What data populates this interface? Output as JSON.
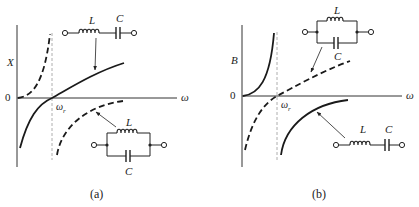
{
  "panels": [
    {
      "id": "a",
      "caption": "(a)",
      "y_axis_label": "X",
      "x_axis_label": "ω",
      "origin_label": "0",
      "resonance_label": "ω",
      "resonance_subscript": "r",
      "series_circuit": {
        "inductor_label": "L",
        "capacitor_label": "C",
        "curve_style": "solid"
      },
      "parallel_circuit": {
        "inductor_label": "L",
        "capacitor_label": "C",
        "curve_style": "dashed"
      }
    },
    {
      "id": "b",
      "caption": "(b)",
      "y_axis_label": "B",
      "x_axis_label": "ω",
      "origin_label": "0",
      "resonance_label": "ω",
      "resonance_subscript": "r",
      "parallel_circuit": {
        "inductor_label": "L",
        "capacitor_label": "C",
        "curve_style": "dashed"
      },
      "series_circuit": {
        "inductor_label": "L",
        "capacitor_label": "C",
        "curve_style": "solid"
      }
    }
  ],
  "colors": {
    "line": "#1a1a1a",
    "axis": "#333333",
    "guide": "#888888"
  }
}
